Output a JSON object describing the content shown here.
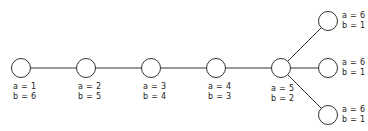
{
  "diagram": {
    "type": "tree",
    "stroke_color": "#333333",
    "nodes": [
      {
        "id": "n1",
        "x": 21,
        "y": 68,
        "a": "a = 1",
        "b": "b = 6",
        "label_pos": "below"
      },
      {
        "id": "n2",
        "x": 86,
        "y": 68,
        "a": "a = 2",
        "b": "b = 5",
        "label_pos": "below"
      },
      {
        "id": "n3",
        "x": 151,
        "y": 68,
        "a": "a = 3",
        "b": "b = 4",
        "label_pos": "below"
      },
      {
        "id": "n4",
        "x": 216,
        "y": 68,
        "a": "a = 4",
        "b": "b = 3",
        "label_pos": "below"
      },
      {
        "id": "n5",
        "x": 281,
        "y": 68,
        "a": "a = 5",
        "b": "b = 2",
        "label_pos": "below"
      },
      {
        "id": "n6",
        "x": 328,
        "y": 21,
        "a": "a = 6",
        "b": "b = 1",
        "label_pos": "right"
      },
      {
        "id": "n7",
        "x": 328,
        "y": 68,
        "a": "a = 6",
        "b": "b = 1",
        "label_pos": "right"
      },
      {
        "id": "n8",
        "x": 328,
        "y": 115,
        "a": "a = 6",
        "b": "b = 1",
        "label_pos": "right"
      }
    ],
    "edges": [
      [
        "n1",
        "n2"
      ],
      [
        "n2",
        "n3"
      ],
      [
        "n3",
        "n4"
      ],
      [
        "n4",
        "n5"
      ],
      [
        "n5",
        "n6"
      ],
      [
        "n5",
        "n7"
      ],
      [
        "n5",
        "n8"
      ]
    ]
  }
}
